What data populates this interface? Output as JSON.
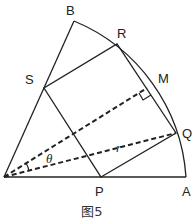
{
  "figure": {
    "caption": "图5",
    "points": {
      "O": {
        "x": 4,
        "y": 177,
        "label": ""
      },
      "A": {
        "x": 186,
        "y": 177,
        "label": "A"
      },
      "B": {
        "x": 74,
        "y": 21,
        "label": "B"
      },
      "R": {
        "x": 117,
        "y": 44,
        "label": "R"
      },
      "S": {
        "x": 44,
        "y": 88,
        "label": "S"
      },
      "Q": {
        "x": 176,
        "y": 133,
        "label": "Q"
      },
      "P": {
        "x": 101,
        "y": 177,
        "label": "P"
      },
      "M": {
        "x": 147,
        "y": 88,
        "label": "M"
      }
    },
    "angle_label": "θ",
    "radius_label": "r",
    "colors": {
      "stroke": "#222222",
      "background": "#ffffff"
    }
  }
}
